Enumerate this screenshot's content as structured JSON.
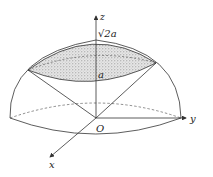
{
  "diagram": {
    "labels": {
      "z_axis": "z",
      "y_axis": "y",
      "x_axis": "x",
      "origin": "O",
      "height_mark": "√2a",
      "cap_mark": "a"
    },
    "colors": {
      "stroke": "#333333",
      "cap_fill": "#d8d8d8",
      "background": "#ffffff"
    }
  }
}
